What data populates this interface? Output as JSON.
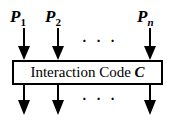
{
  "inputs": [
    {
      "name": "P",
      "sub": "1"
    },
    {
      "name": "P",
      "sub": "2"
    },
    {
      "name": "P",
      "sub": "n"
    }
  ],
  "ellipsis": "· · ·",
  "box": {
    "text": "Interaction Code ",
    "symbol": "C"
  }
}
